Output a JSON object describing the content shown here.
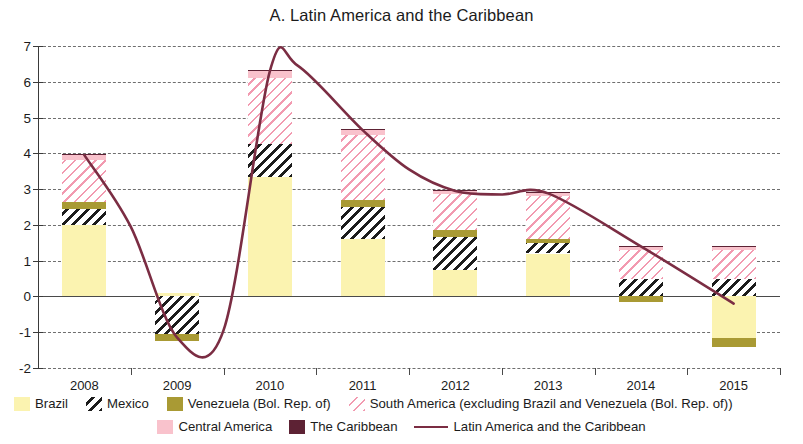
{
  "chart_data": {
    "type": "bar",
    "title": "A. Latin America and the Caribbean",
    "xlabel": "",
    "ylabel": "",
    "ylim": [
      -2,
      7
    ],
    "ytick_step": 1,
    "yticks": [
      "7",
      "6",
      "5",
      "4",
      "3",
      "2",
      "1",
      "0",
      "-1",
      "-2"
    ],
    "grid": true,
    "legend_position": "bottom",
    "categories": [
      "2008",
      "2009",
      "2010",
      "2011",
      "2012",
      "2013",
      "2014",
      "2015"
    ],
    "stacked": true,
    "series": [
      {
        "name": "Brazil",
        "color": "#fbf3b0",
        "pattern": "solid",
        "values": [
          2.0,
          0.1,
          3.35,
          1.6,
          0.75,
          1.2,
          0.0,
          -1.15
        ]
      },
      {
        "name": "Mexico",
        "color": "#1c1c1c",
        "pattern": "diagonal-hatch-black",
        "values": [
          0.45,
          -1.05,
          0.9,
          0.9,
          0.9,
          0.3,
          0.5,
          0.5
        ]
      },
      {
        "name": "Venezuela (Bol. Rep. of)",
        "color": "#a99a34",
        "pattern": "solid",
        "values": [
          0.2,
          -0.2,
          0.0,
          0.2,
          0.2,
          0.1,
          -0.15,
          -0.25
        ]
      },
      {
        "name": "South America (excluding Brazil and Venezuela (Bol. Rep. of))",
        "color": "#f29ab0",
        "pattern": "diagonal-hatch-pink",
        "values": [
          1.15,
          0.0,
          1.85,
          1.8,
          1.0,
          1.2,
          0.8,
          0.8
        ]
      },
      {
        "name": "Central America",
        "color": "#f9c2cc",
        "pattern": "solid",
        "values": [
          0.15,
          0.0,
          0.2,
          0.15,
          0.1,
          0.1,
          0.1,
          0.1
        ]
      },
      {
        "name": "The Caribbean",
        "color": "#5d2234",
        "pattern": "solid",
        "values": [
          0.03,
          0.0,
          0.03,
          0.03,
          0.02,
          0.02,
          0.02,
          0.02
        ]
      }
    ],
    "line_series": {
      "name": "Latin America and the Caribbean",
      "color": "#7b2d43",
      "points": [
        {
          "x": "2008",
          "value": 3.95
        },
        {
          "x": "2008.5",
          "value": 1.95
        },
        {
          "x": "2009",
          "value": -1.15
        },
        {
          "x": "2009.5",
          "value": -0.95
        },
        {
          "x": "2010",
          "value": 6.3
        },
        {
          "x": "2010.3",
          "value": 6.45
        },
        {
          "x": "2011",
          "value": 4.65
        },
        {
          "x": "2011.5",
          "value": 3.55
        },
        {
          "x": "2012",
          "value": 2.95
        },
        {
          "x": "2012.5",
          "value": 2.85
        },
        {
          "x": "2013",
          "value": 2.88
        },
        {
          "x": "2014",
          "value": 1.4
        },
        {
          "x": "2015",
          "value": -0.2
        }
      ]
    }
  },
  "legend": {
    "row1": [
      {
        "label": "Brazil",
        "swatch": "sw-brazil",
        "name": "legend-swatch-brazil"
      },
      {
        "label": "Mexico",
        "swatch": "sw-mexico",
        "name": "legend-swatch-mexico"
      },
      {
        "label": "Venezuela (Bol. Rep. of)",
        "swatch": "sw-venezuela",
        "name": "legend-swatch-venezuela"
      },
      {
        "label": "South America (excluding Brazil and Venezuela (Bol. Rep. of))",
        "swatch": "sw-southam",
        "name": "legend-swatch-south-america"
      }
    ],
    "row2": [
      {
        "label": "Central America",
        "swatch": "sw-central",
        "name": "legend-swatch-central-america"
      },
      {
        "label": "The Caribbean",
        "swatch": "sw-caribbean",
        "name": "legend-swatch-caribbean"
      },
      {
        "label": "Latin America and the Caribbean",
        "swatch": "sw-line",
        "name": "legend-swatch-line"
      }
    ]
  }
}
